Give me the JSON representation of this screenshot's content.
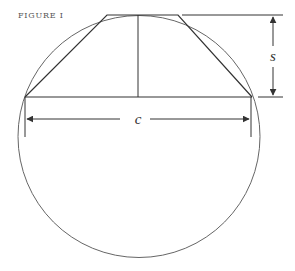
{
  "figure": {
    "label": "FIGURE I",
    "labels": {
      "chord": "c",
      "sagitta": "s"
    },
    "colors": {
      "stroke": "#333333",
      "circle": "#666666",
      "label_text": "#555555"
    }
  }
}
